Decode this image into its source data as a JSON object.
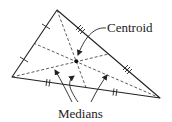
{
  "diagram": {
    "labels": {
      "centroid": "Centroid",
      "medians": "Medians"
    },
    "vertices": {
      "A": [
        57,
        10
      ],
      "B": [
        12,
        77
      ],
      "C": [
        160,
        98
      ]
    },
    "midpoints": {
      "AB": [
        34.5,
        43.5
      ],
      "AC": [
        108.5,
        54
      ],
      "BC": [
        86,
        87.5
      ]
    },
    "centroid_point": [
      76.3,
      61.7
    ],
    "colors": {
      "stroke": "#222222",
      "background": "#ffffff"
    }
  }
}
